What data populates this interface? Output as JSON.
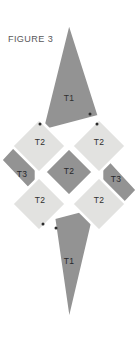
{
  "figure": {
    "title": "FIGURE 3",
    "caption_position": "top-left"
  },
  "colors": {
    "background": "#ffffff",
    "dark_fill": "#939393",
    "light_fill": "#e2e2e0",
    "label_text": "#2f2f2f",
    "title_text": "#58585a",
    "vertex_dot": "#2b2b2b",
    "gap": "#ffffff"
  },
  "shapes": [
    {
      "id": "triangle-top",
      "label": "T1",
      "kind": "triangle",
      "fill": "dark",
      "label_x": 69,
      "label_y": 99,
      "points": "69,22 99,116 42,131"
    },
    {
      "id": "diamond-upper-left",
      "label": "T2",
      "kind": "diamond",
      "fill": "light",
      "label_x": 40,
      "label_y": 143,
      "points": "39,119 66,146 39,173 12,146"
    },
    {
      "id": "diamond-upper-right",
      "label": "T2",
      "kind": "diamond",
      "fill": "light",
      "label_x": 99,
      "label_y": 143,
      "points": "99,119 126,146 99,173 72,146"
    },
    {
      "id": "diamond-center",
      "label": "T2",
      "kind": "diamond",
      "fill": "dark",
      "label_x": 69,
      "label_y": 172,
      "points": "69,148 93,172 69,196 45,172"
    },
    {
      "id": "diamond-lower-left",
      "label": "T2",
      "kind": "diamond",
      "fill": "light",
      "label_x": 40,
      "label_y": 201,
      "points": "39,177 66,204 39,231 12,204"
    },
    {
      "id": "diamond-lower-right",
      "label": "T2",
      "kind": "diamond",
      "fill": "light",
      "label_x": 99,
      "label_y": 201,
      "points": "99,177 126,204 99,231 72,204"
    },
    {
      "id": "triangle-left",
      "label": "T3",
      "kind": "triangle",
      "fill": "dark",
      "label_x": 22,
      "label_y": 175,
      "points": "36,122 36,197 1,160"
    },
    {
      "id": "triangle-right",
      "label": "T3",
      "kind": "triangle",
      "fill": "dark",
      "label_x": 116,
      "label_y": 180,
      "points": "102,152 137,190 102,227"
    },
    {
      "id": "triangle-bottom",
      "label": "T1",
      "kind": "triangle",
      "fill": "dark",
      "label_x": 69,
      "label_y": 262,
      "points": "54,218 96,207 69,322"
    }
  ],
  "vertex_dots": [
    {
      "id": "dot-top-triangle-right",
      "x": 90,
      "y": 114
    },
    {
      "id": "dot-upper-left-diamond-top",
      "x": 40,
      "y": 124
    },
    {
      "id": "dot-upper-right-diamond-top",
      "x": 97,
      "y": 124
    },
    {
      "id": "dot-lower-left-diamond-bottom",
      "x": 43,
      "y": 224
    },
    {
      "id": "dot-bottom-triangle-left",
      "x": 56,
      "y": 228
    }
  ]
}
